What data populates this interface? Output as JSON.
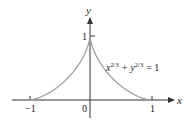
{
  "chart_data": {
    "type": "line",
    "title": "",
    "xlabel": "x",
    "ylabel": "y",
    "equation": {
      "base_x": "x",
      "exp_x": "2/3",
      "plus": "+",
      "base_y": "y",
      "exp_y": "2/3",
      "rhs": "= 1"
    },
    "x_ticks": [
      {
        "value": -1,
        "label": "−1"
      },
      {
        "value": 0,
        "label": "0"
      },
      {
        "value": 1,
        "label": "1"
      }
    ],
    "y_ticks": [
      {
        "value": 1,
        "label": "1"
      }
    ],
    "xlim": [
      -1.3,
      1.35
    ],
    "ylim": [
      0,
      1.3
    ],
    "series": [
      {
        "name": "x^(2/3) + y^(2/3) = 1 (upper half)",
        "x": [
          -1,
          -0.9,
          -0.8,
          -0.7,
          -0.6,
          -0.5,
          -0.4,
          -0.3,
          -0.2,
          -0.1,
          -0.05,
          0,
          0.05,
          0.1,
          0.2,
          0.3,
          0.4,
          0.5,
          0.6,
          0.7,
          0.8,
          0.9,
          1
        ],
        "y": [
          0,
          0.001,
          0.009,
          0.026,
          0.056,
          0.101,
          0.166,
          0.257,
          0.383,
          0.568,
          0.714,
          1,
          0.714,
          0.568,
          0.383,
          0.257,
          0.166,
          0.101,
          0.056,
          0.026,
          0.009,
          0.001,
          0
        ]
      }
    ],
    "grid": false,
    "legend": "none",
    "colors": {
      "axis": "#333333",
      "curve": "#9a9a9a",
      "text": "#222222"
    }
  }
}
